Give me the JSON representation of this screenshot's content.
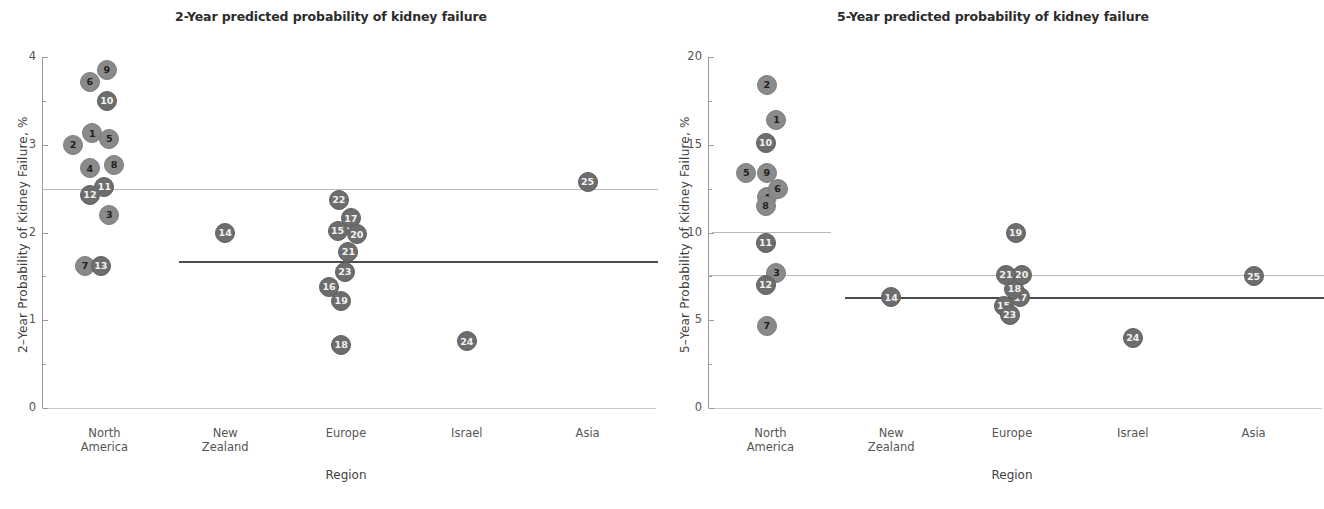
{
  "figure": {
    "axis_title_x": "Region",
    "categories": [
      "North America",
      "New Zealand",
      "Europe",
      "Israel",
      "Asia"
    ]
  },
  "chart_data": [
    {
      "type": "scatter",
      "panel": "left",
      "title": "2-Year predicted probability of kidney failure",
      "xlabel": "Region",
      "ylabel": "2–Year Probability of Kidney Failure, %",
      "ylim": [
        0,
        4
      ],
      "yticks": [
        0,
        1,
        2,
        3,
        4
      ],
      "ytick_labels": [
        "0",
        "1",
        "2",
        "3",
        "4"
      ],
      "categories": [
        "North America",
        "New Zealand",
        "Europe",
        "Israel",
        "Asia"
      ],
      "grid": false,
      "legend": "none",
      "reference_lines": [
        {
          "name": "overall-reference-line",
          "value": 2.5,
          "style": "light",
          "span": "full"
        },
        {
          "name": "pooled-estimate-line",
          "value": 1.67,
          "style": "dark",
          "span": "new-zealand-to-asia"
        }
      ],
      "points": [
        {
          "label": "1",
          "category": "North America",
          "x_offset": -0.1,
          "value": 3.13
        },
        {
          "label": "2",
          "category": "North America",
          "x_offset": -0.26,
          "value": 3.0
        },
        {
          "label": "3",
          "category": "North America",
          "x_offset": 0.04,
          "value": 2.2
        },
        {
          "label": "4",
          "category": "North America",
          "x_offset": -0.12,
          "value": 2.73
        },
        {
          "label": "5",
          "category": "North America",
          "x_offset": 0.04,
          "value": 3.07
        },
        {
          "label": "6",
          "category": "North America",
          "x_offset": -0.12,
          "value": 3.72
        },
        {
          "label": "7",
          "category": "North America",
          "x_offset": -0.16,
          "value": 1.62
        },
        {
          "label": "8",
          "category": "North America",
          "x_offset": 0.08,
          "value": 2.77
        },
        {
          "label": "9",
          "category": "North America",
          "x_offset": 0.02,
          "value": 3.85
        },
        {
          "label": "10",
          "category": "North America",
          "x_offset": 0.02,
          "value": 3.5
        },
        {
          "label": "11",
          "category": "North America",
          "x_offset": 0.0,
          "value": 2.52
        },
        {
          "label": "12",
          "category": "North America",
          "x_offset": -0.12,
          "value": 2.43
        },
        {
          "label": "13",
          "category": "North America",
          "x_offset": -0.03,
          "value": 1.62
        },
        {
          "label": "14",
          "category": "New Zealand",
          "x_offset": 0.0,
          "value": 2.0
        },
        {
          "label": "15",
          "category": "Europe",
          "x_offset": -0.07,
          "value": 2.02
        },
        {
          "label": "16",
          "category": "Europe",
          "x_offset": -0.14,
          "value": 1.38
        },
        {
          "label": "17",
          "category": "Europe",
          "x_offset": 0.04,
          "value": 2.16
        },
        {
          "label": "18",
          "category": "Europe",
          "x_offset": -0.04,
          "value": 0.72
        },
        {
          "label": "19",
          "category": "Europe",
          "x_offset": -0.04,
          "value": 1.22
        },
        {
          "label": "20",
          "category": "Europe",
          "x_offset": 0.09,
          "value": 1.98
        },
        {
          "label": "21",
          "category": "Europe",
          "x_offset": 0.02,
          "value": 1.78
        },
        {
          "label": "22",
          "category": "Europe",
          "x_offset": -0.06,
          "value": 2.37
        },
        {
          "label": "23",
          "category": "Europe",
          "x_offset": -0.01,
          "value": 1.55
        },
        {
          "label": "24",
          "category": "Israel",
          "x_offset": 0.0,
          "value": 0.76
        },
        {
          "label": "25",
          "category": "Asia",
          "x_offset": 0.0,
          "value": 2.58
        }
      ]
    },
    {
      "type": "scatter",
      "panel": "right",
      "title": "5-Year predicted probability of kidney failure",
      "xlabel": "Region",
      "ylabel": "5–Year Probability of Kidney Failure, %",
      "ylim": [
        0,
        20
      ],
      "yticks": [
        0,
        5,
        10,
        15,
        20
      ],
      "ytick_labels": [
        "0",
        "5",
        "10",
        "15",
        "20"
      ],
      "categories": [
        "North America",
        "New Zealand",
        "Europe",
        "Israel",
        "Asia"
      ],
      "grid": false,
      "legend": "none",
      "reference_lines": [
        {
          "name": "north-america-reference-line",
          "value": 10.05,
          "style": "light",
          "span": "north-america"
        },
        {
          "name": "overall-reference-line",
          "value": 7.55,
          "style": "light",
          "span": "full"
        },
        {
          "name": "pooled-estimate-line",
          "value": 6.3,
          "style": "dark",
          "span": "new-zealand-to-asia"
        }
      ],
      "points": [
        {
          "label": "1",
          "category": "North America",
          "x_offset": 0.05,
          "value": 16.4
        },
        {
          "label": "2",
          "category": "North America",
          "x_offset": -0.03,
          "value": 18.4
        },
        {
          "label": "3",
          "category": "North America",
          "x_offset": 0.05,
          "value": 7.7
        },
        {
          "label": "4",
          "category": "North America",
          "x_offset": -0.03,
          "value": 12.0
        },
        {
          "label": "5",
          "category": "North America",
          "x_offset": -0.2,
          "value": 13.4
        },
        {
          "label": "6",
          "category": "North America",
          "x_offset": 0.06,
          "value": 12.5
        },
        {
          "label": "7",
          "category": "North America",
          "x_offset": -0.03,
          "value": 4.7
        },
        {
          "label": "8",
          "category": "North America",
          "x_offset": -0.04,
          "value": 11.5
        },
        {
          "label": "9",
          "category": "North America",
          "x_offset": -0.03,
          "value": 13.4
        },
        {
          "label": "10",
          "category": "North America",
          "x_offset": -0.04,
          "value": 15.1
        },
        {
          "label": "11",
          "category": "North America",
          "x_offset": -0.04,
          "value": 9.4
        },
        {
          "label": "12",
          "category": "North America",
          "x_offset": -0.04,
          "value": 7.0
        },
        {
          "label": "14",
          "category": "New Zealand",
          "x_offset": 0.0,
          "value": 6.3
        },
        {
          "label": "15",
          "category": "Europe",
          "x_offset": -0.07,
          "value": 5.8
        },
        {
          "label": "17",
          "category": "Europe",
          "x_offset": 0.07,
          "value": 6.3
        },
        {
          "label": "18",
          "category": "Europe",
          "x_offset": 0.02,
          "value": 6.8
        },
        {
          "label": "19",
          "category": "Europe",
          "x_offset": 0.03,
          "value": 10.0
        },
        {
          "label": "20",
          "category": "Europe",
          "x_offset": 0.08,
          "value": 7.6
        },
        {
          "label": "21",
          "category": "Europe",
          "x_offset": -0.05,
          "value": 7.6
        },
        {
          "label": "23",
          "category": "Europe",
          "x_offset": -0.02,
          "value": 5.3
        },
        {
          "label": "24",
          "category": "Israel",
          "x_offset": 0.0,
          "value": 4.0
        },
        {
          "label": "25",
          "category": "Asia",
          "x_offset": 0.0,
          "value": 7.5
        }
      ]
    }
  ]
}
